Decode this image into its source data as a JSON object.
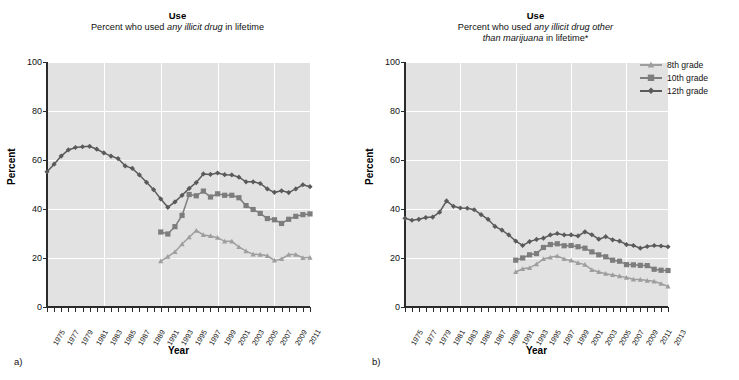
{
  "figure": {
    "panels": [
      {
        "id": "a",
        "panel_label": "a)",
        "title": "Use",
        "subtitle_part1": "Percent who used ",
        "subtitle_em": "any illicit drug",
        "subtitle_part2": " in lifetime"
      },
      {
        "id": "b",
        "panel_label": "b)",
        "title": "Use",
        "subtitle_part1": "Percent who used ",
        "subtitle_em": "any illicit drug other",
        "subtitle_em2": "than marijuana",
        "subtitle_part2": " in lifetime*"
      }
    ],
    "legend": {
      "position": "right",
      "items": [
        {
          "label": "8th grade",
          "marker": "triangle-icon",
          "color": "#9e9e9e"
        },
        {
          "label": "10th grade",
          "marker": "square-icon",
          "color": "#7d7d7d"
        },
        {
          "label": "12th grade",
          "marker": "diamond-icon",
          "color": "#5a5a5a"
        }
      ]
    },
    "colors": {
      "plot_background": "#e2e2e2",
      "gridline": "#ffffff",
      "axis": "#2b2b2b",
      "grade8": "#9e9e9e",
      "grade10": "#7d7d7d",
      "grade12": "#5a5a5a"
    }
  },
  "chart_data": [
    {
      "type": "line",
      "panel": "a",
      "title": "Use",
      "subtitle": "Percent who used any illicit drug in lifetime",
      "xlabel": "Year",
      "ylabel": "Percent",
      "ylim": [
        0,
        100
      ],
      "yticks": [
        0,
        20,
        40,
        60,
        80,
        100
      ],
      "grid": true,
      "xlim": [
        1975,
        2012
      ],
      "xticks": [
        1975,
        1977,
        1979,
        1981,
        1983,
        1985,
        1987,
        1989,
        1991,
        1993,
        1995,
        1997,
        1999,
        2001,
        2003,
        2005,
        2007,
        2009,
        2011
      ],
      "x": [
        1975,
        1976,
        1977,
        1978,
        1979,
        1980,
        1981,
        1982,
        1983,
        1984,
        1985,
        1986,
        1987,
        1988,
        1989,
        1990,
        1991,
        1992,
        1993,
        1994,
        1995,
        1996,
        1997,
        1998,
        1999,
        2000,
        2001,
        2002,
        2003,
        2004,
        2005,
        2006,
        2007,
        2008,
        2009,
        2010,
        2011,
        2012
      ],
      "series": [
        {
          "name": "8th grade",
          "marker": "triangle",
          "color": "#9e9e9e",
          "x": [
            1991,
            1992,
            1993,
            1994,
            1995,
            1996,
            1997,
            1998,
            1999,
            2000,
            2001,
            2002,
            2003,
            2004,
            2005,
            2006,
            2007,
            2008,
            2009,
            2010,
            2011,
            2012
          ],
          "values": [
            18.7,
            20.6,
            22.5,
            25.7,
            28.5,
            31.2,
            29.4,
            29.0,
            28.3,
            26.8,
            26.8,
            24.5,
            22.8,
            21.5,
            21.4,
            20.9,
            19.0,
            19.6,
            21.4,
            21.4,
            20.1,
            20.2
          ]
        },
        {
          "name": "10th grade",
          "marker": "square",
          "color": "#7d7d7d",
          "x": [
            1991,
            1992,
            1993,
            1994,
            1995,
            1996,
            1997,
            1998,
            1999,
            2000,
            2001,
            2002,
            2003,
            2004,
            2005,
            2006,
            2007,
            2008,
            2009,
            2010,
            2011,
            2012
          ],
          "values": [
            30.6,
            29.8,
            32.8,
            37.4,
            45.9,
            45.4,
            47.3,
            44.9,
            46.2,
            45.6,
            45.6,
            44.6,
            41.4,
            39.8,
            38.2,
            36.1,
            35.6,
            34.1,
            35.8,
            37.0,
            37.7,
            38.0
          ]
        },
        {
          "name": "12th grade",
          "marker": "diamond",
          "color": "#5a5a5a",
          "x": [
            1975,
            1976,
            1977,
            1978,
            1979,
            1980,
            1981,
            1982,
            1983,
            1984,
            1985,
            1986,
            1987,
            1988,
            1989,
            1990,
            1991,
            1992,
            1993,
            1994,
            1995,
            1996,
            1997,
            1998,
            1999,
            2000,
            2001,
            2002,
            2003,
            2004,
            2005,
            2006,
            2007,
            2008,
            2009,
            2010,
            2011,
            2012
          ],
          "values": [
            55.2,
            58.3,
            61.6,
            64.1,
            65.1,
            65.4,
            65.6,
            64.4,
            62.9,
            61.6,
            60.6,
            57.6,
            56.6,
            53.9,
            50.9,
            47.9,
            44.1,
            40.7,
            42.9,
            45.6,
            48.4,
            50.8,
            54.3,
            54.1,
            54.7,
            54.0,
            53.9,
            53.0,
            51.1,
            51.1,
            50.4,
            48.2,
            46.8,
            47.4,
            46.7,
            48.2,
            49.9,
            49.1
          ]
        }
      ]
    },
    {
      "type": "line",
      "panel": "b",
      "title": "Use",
      "subtitle": "Percent who used any illicit drug other than marijuana in lifetime*",
      "xlabel": "Year",
      "ylabel": "Percent",
      "ylim": [
        0,
        100
      ],
      "yticks": [
        0,
        20,
        40,
        60,
        80,
        100
      ],
      "grid": true,
      "xlim": [
        1975,
        2013
      ],
      "xticks": [
        1975,
        1977,
        1979,
        1981,
        1983,
        1985,
        1987,
        1989,
        1991,
        1993,
        1995,
        1997,
        1999,
        2001,
        2003,
        2005,
        2007,
        2009,
        2011,
        2013
      ],
      "x": [
        1975,
        1976,
        1977,
        1978,
        1979,
        1980,
        1981,
        1982,
        1983,
        1984,
        1985,
        1986,
        1987,
        1988,
        1989,
        1990,
        1991,
        1992,
        1993,
        1994,
        1995,
        1996,
        1997,
        1998,
        1999,
        2000,
        2001,
        2002,
        2003,
        2004,
        2005,
        2006,
        2007,
        2008,
        2009,
        2010,
        2011,
        2012,
        2013
      ],
      "series": [
        {
          "name": "8th grade",
          "marker": "triangle",
          "color": "#9e9e9e",
          "x": [
            1991,
            1992,
            1993,
            1994,
            1995,
            1996,
            1997,
            1998,
            1999,
            2000,
            2001,
            2002,
            2003,
            2004,
            2005,
            2006,
            2007,
            2008,
            2009,
            2010,
            2011,
            2012,
            2013
          ],
          "values": [
            14.3,
            15.6,
            16.0,
            17.5,
            19.6,
            20.3,
            20.8,
            19.6,
            19.0,
            18.0,
            17.3,
            15.2,
            14.3,
            13.6,
            13.1,
            12.6,
            12.0,
            11.3,
            11.2,
            10.8,
            10.5,
            9.5,
            8.4
          ]
        },
        {
          "name": "10th grade",
          "marker": "square",
          "color": "#7d7d7d",
          "x": [
            1991,
            1992,
            1993,
            1994,
            1995,
            1996,
            1997,
            1998,
            1999,
            2000,
            2001,
            2002,
            2003,
            2004,
            2005,
            2006,
            2007,
            2008,
            2009,
            2010,
            2011,
            2012,
            2013
          ],
          "values": [
            19.1,
            20.0,
            21.3,
            21.8,
            24.3,
            25.5,
            25.8,
            25.0,
            25.1,
            24.6,
            24.0,
            22.5,
            21.3,
            20.5,
            19.1,
            18.7,
            17.3,
            17.2,
            17.0,
            16.9,
            15.4,
            15.0,
            14.9
          ]
        },
        {
          "name": "12th grade",
          "marker": "diamond",
          "color": "#5a5a5a",
          "x": [
            1975,
            1976,
            1977,
            1978,
            1979,
            1980,
            1981,
            1982,
            1983,
            1984,
            1985,
            1986,
            1987,
            1988,
            1989,
            1990,
            1991,
            1992,
            1993,
            1994,
            1995,
            1996,
            1997,
            1998,
            1999,
            2000,
            2001,
            2002,
            2003,
            2004,
            2005,
            2006,
            2007,
            2008,
            2009,
            2010,
            2011,
            2012,
            2013
          ],
          "values": [
            36.2,
            35.4,
            35.8,
            36.5,
            36.7,
            38.7,
            43.3,
            41.1,
            40.4,
            40.3,
            39.7,
            37.7,
            35.8,
            32.9,
            31.4,
            29.4,
            26.9,
            25.1,
            26.7,
            27.6,
            28.1,
            29.4,
            30.0,
            29.4,
            29.4,
            29.0,
            30.7,
            29.5,
            27.7,
            28.7,
            27.4,
            26.9,
            25.5,
            25.1,
            24.0,
            24.7,
            25.1,
            24.9,
            24.6
          ]
        }
      ]
    }
  ]
}
